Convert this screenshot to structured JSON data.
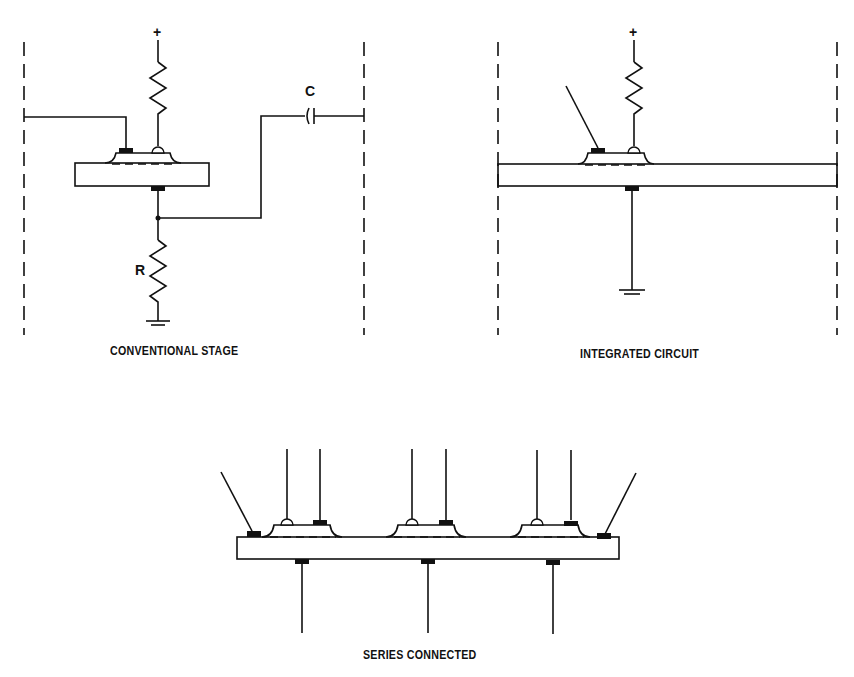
{
  "diagrams": {
    "conventional": {
      "caption": "CONVENTIONAL STAGE",
      "plus": "+",
      "resistor_label": "R",
      "capacitor_label": "C"
    },
    "integrated": {
      "caption": "INTEGRATED CIRCUIT",
      "plus": "+"
    },
    "series": {
      "caption": "SERIES CONNECTED"
    }
  },
  "colors": {
    "ink": "#111111",
    "background": "#ffffff"
  }
}
